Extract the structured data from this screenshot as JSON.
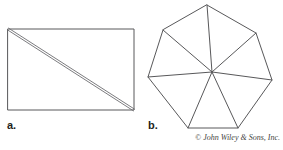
{
  "figure": {
    "background_color": "#ffffff",
    "stroke_color": "#58585a",
    "width": 283,
    "height": 150
  },
  "panels": [
    {
      "id": "a",
      "label": "a.",
      "shape": "rectangle-with-diagonal",
      "description": "Rectangle divided by a drawn diagonal from the top-left corner to the bottom-right corner, rendered as a narrow double line.",
      "vertices": [
        [
          8,
          29
        ],
        [
          134,
          29
        ],
        [
          134,
          110
        ],
        [
          8,
          110
        ]
      ],
      "diagonal": {
        "from": [
          8,
          29
        ],
        "to": [
          134,
          110
        ],
        "rendered_as": "double-line",
        "offset_px": 2
      },
      "triangle_count": 2
    },
    {
      "id": "b",
      "label": "b.",
      "shape": "heptagon-triangulated",
      "description": "Regular heptagon triangulated by segments drawn from an interior point to each of the seven vertices.",
      "vertices": [
        [
          207,
          5
        ],
        [
          256,
          33
        ],
        [
          272,
          80
        ],
        [
          238,
          128
        ],
        [
          188,
          128
        ],
        [
          148,
          77
        ],
        [
          163,
          30
        ]
      ],
      "interior_point": [
        212,
        72
      ],
      "triangle_count": 7
    }
  ],
  "credit": {
    "text": "© John Wiley & Sons, Inc.",
    "color": "#3f3f41"
  }
}
